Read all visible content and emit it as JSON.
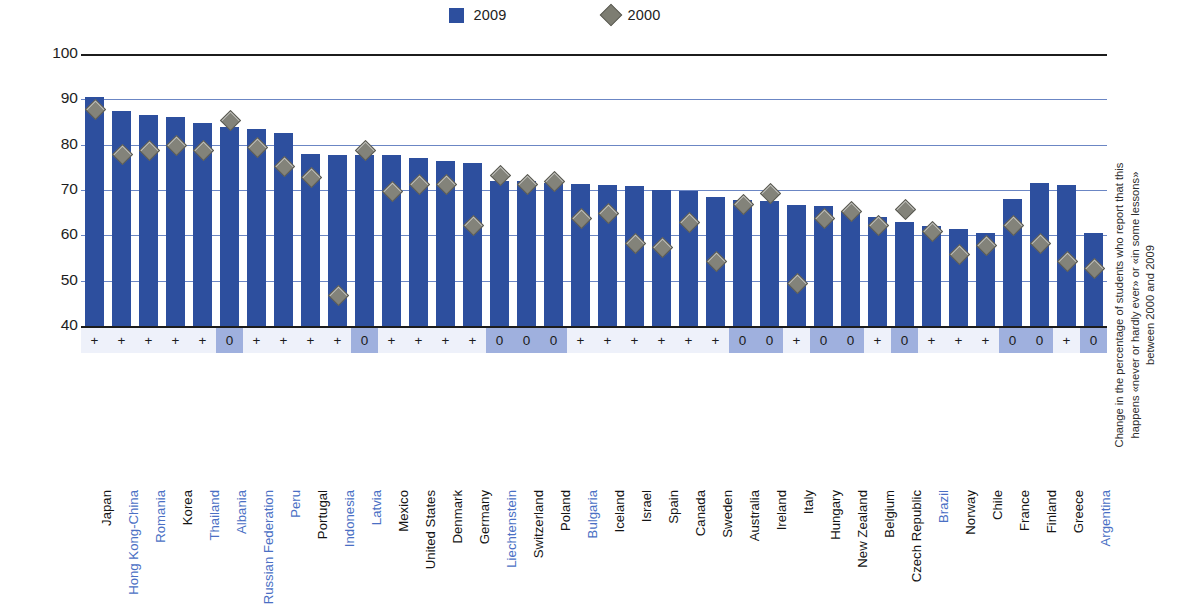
{
  "legend": {
    "series_2009_label": "2009",
    "series_2000_label": "2000",
    "color_2009": "#2d4f9e",
    "color_2000": "#83837a"
  },
  "axis": {
    "ylabel": "Percentage of students",
    "yticks": [
      "100",
      "90",
      "80",
      "70",
      "60",
      "50",
      "40"
    ]
  },
  "right_note": "Change in the percentage of students who report that this happens «never or hardly ever» or «in some lessons» between 2000 and 2009",
  "significance": {
    "positive_symbol": "+",
    "zero_symbol": "0"
  },
  "chart_data": {
    "type": "bar",
    "title": "",
    "xlabel": "",
    "ylabel": "Percentage of students",
    "ylim": [
      40,
      100
    ],
    "yticks": [
      40,
      50,
      60,
      70,
      80,
      90,
      100
    ],
    "grid": true,
    "legend_position": "top-center",
    "categories": [
      "Japan",
      "Hong Kong-China",
      "Romania",
      "Korea",
      "Thailand",
      "Albania",
      "Russian Federation",
      "Peru",
      "Portugal",
      "Indonesia",
      "Latvia",
      "Mexico",
      "United States",
      "Denmark",
      "Germany",
      "Liechtenstein",
      "Switzerland",
      "Poland",
      "Bulgaria",
      "Iceland",
      "Israel",
      "Spain",
      "Canada",
      "Sweden",
      "Australia",
      "Ireland",
      "Italy",
      "Hungary",
      "New Zealand",
      "Belgium",
      "Czech Republic",
      "Brazil",
      "Norway",
      "Chile",
      "France",
      "Finland",
      "Greece",
      "Argentina"
    ],
    "category_types": [
      "oecd",
      "partner",
      "partner",
      "oecd",
      "partner",
      "partner",
      "partner",
      "partner",
      "oecd",
      "partner",
      "partner",
      "oecd",
      "oecd",
      "oecd",
      "oecd",
      "partner",
      "oecd",
      "oecd",
      "partner",
      "oecd",
      "oecd",
      "oecd",
      "oecd",
      "oecd",
      "oecd",
      "oecd",
      "oecd",
      "oecd",
      "oecd",
      "oecd",
      "oecd",
      "partner",
      "oecd",
      "oecd",
      "oecd",
      "oecd",
      "oecd",
      "partner"
    ],
    "series": [
      {
        "name": "2009",
        "values": [
          90.5,
          87.5,
          86.5,
          86.0,
          84.8,
          84.0,
          83.5,
          82.5,
          78.0,
          77.8,
          77.8,
          77.8,
          77.0,
          76.5,
          76.0,
          72.0,
          72.0,
          71.5,
          71.3,
          71.2,
          70.8,
          70.0,
          69.8,
          68.5,
          67.8,
          67.5,
          66.8,
          66.5,
          65.3,
          64.0,
          63.0,
          62.0,
          61.5,
          60.5,
          68.0,
          71.5,
          71.2,
          60.5
        ]
      },
      {
        "name": "2000",
        "values": [
          88.0,
          78.0,
          79.0,
          80.0,
          79.0,
          85.5,
          79.5,
          75.5,
          73.0,
          47.0,
          79.0,
          70.0,
          71.5,
          71.5,
          62.5,
          73.5,
          71.5,
          72.0,
          64.0,
          65.0,
          58.5,
          57.5,
          63.0,
          54.5,
          67.0,
          69.5,
          49.5,
          64.0,
          65.5,
          62.5,
          66.0,
          61.0,
          56.0,
          58.0,
          62.5,
          58.5,
          54.5,
          53.0
        ]
      }
    ],
    "significance_markers": [
      "+",
      "+",
      "+",
      "+",
      "+",
      "0",
      "+",
      "+",
      "+",
      "+",
      "0",
      "+",
      "+",
      "+",
      "+",
      "0",
      "0",
      "0",
      "+",
      "+",
      "+",
      "+",
      "+",
      "+",
      "0",
      "0",
      "+",
      "0",
      "0",
      "+",
      "0",
      "+",
      "+",
      "+",
      "0",
      "0",
      "+",
      "0"
    ]
  }
}
